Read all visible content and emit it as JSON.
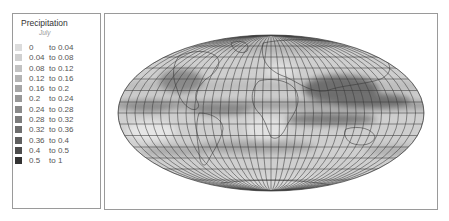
{
  "legend": {
    "title": "Precipitation",
    "subtitle": "July",
    "items": [
      {
        "lo": "0",
        "hi": "to 0.04",
        "color": "#dcdcdc"
      },
      {
        "lo": "0.04",
        "hi": "to 0.08",
        "color": "#d0d0d0"
      },
      {
        "lo": "0.08",
        "hi": "to 0.12",
        "color": "#c2c2c2"
      },
      {
        "lo": "0.12",
        "hi": "to 0.16",
        "color": "#b4b4b4"
      },
      {
        "lo": "0.16",
        "hi": "to 0.2",
        "color": "#a6a6a6"
      },
      {
        "lo": "0.2",
        "hi": "to 0.24",
        "color": "#989898"
      },
      {
        "lo": "0.24",
        "hi": "to 0.28",
        "color": "#8a8a8a"
      },
      {
        "lo": "0.28",
        "hi": "to 0.32",
        "color": "#7c7c7c"
      },
      {
        "lo": "0.32",
        "hi": "to 0.36",
        "color": "#6e6e6e"
      },
      {
        "lo": "0.36",
        "hi": "to 0.4",
        "color": "#5f5f5f"
      },
      {
        "lo": "0.4",
        "hi": "to 0.5",
        "color": "#4c4c4c"
      },
      {
        "lo": "0.5",
        "hi": "to 1",
        "color": "#333333"
      }
    ]
  },
  "map": {
    "projection": "Mollweide",
    "variable": "Precipitation",
    "period": "July",
    "grid_spacing_deg": 10,
    "ocean_base_color": "#cfcfcf",
    "gridline_color": "#3a3a3a"
  }
}
